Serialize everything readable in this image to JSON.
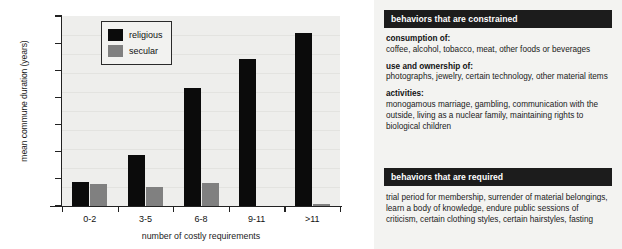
{
  "chart_data": {
    "type": "bar",
    "title": "",
    "xlabel": "number of costly requirements",
    "ylabel": "mean commune duration (years)",
    "categories": [
      "0-2",
      "3-5",
      "6-8",
      "9-11",
      ">11"
    ],
    "series": [
      {
        "name": "religious",
        "color": "#0b0b0b",
        "values": [
          9,
          18.7,
          43.5,
          54.3,
          63.7
        ]
      },
      {
        "name": "secular",
        "color": "#808080",
        "values": [
          8,
          6.9,
          8.5,
          0,
          0.7
        ]
      }
    ],
    "ylim": [
      0,
      70
    ],
    "yticks": [
      0,
      10,
      20,
      30,
      40,
      50,
      60,
      70
    ],
    "grid": false,
    "legend_position": "top-left",
    "legend": [
      "religious",
      "secular"
    ]
  },
  "chart": {
    "y_axis_title": "mean commune duration (years)",
    "x_axis_title": "number of costly requirements",
    "legend": [
      {
        "label": "religious"
      },
      {
        "label": "secular"
      }
    ]
  },
  "info": {
    "constrained": {
      "header": "behaviors that are constrained",
      "groups": [
        {
          "title": "consumption of:",
          "text": "coffee, alcohol, tobacco, meat, other foods or beverages"
        },
        {
          "title": "use and ownership of:",
          "text": "photographs, jewelry, certain technology, other material items"
        },
        {
          "title": "activities:",
          "text": "monogamous marriage, gambling, communication with the outside, living as a nuclear family, maintaining rights to biological children"
        }
      ]
    },
    "required": {
      "header": "behaviors that are required",
      "text": "trial period for membership, surrender of material belongings, learn a body of knowledge, endure public sessions of criticism, certain clothing styles, certain hairstyles, fasting"
    }
  }
}
